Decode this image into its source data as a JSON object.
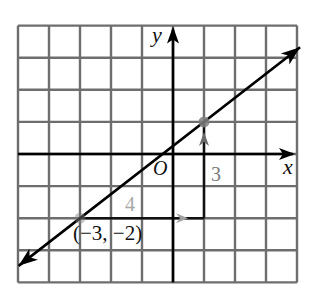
{
  "chart_data": {
    "type": "line",
    "title": "",
    "xlabel": "x",
    "ylabel": "y",
    "origin_label": "O",
    "xlim": [
      -5,
      4
    ],
    "ylim": [
      -4,
      4
    ],
    "grid": true,
    "grid_step": 1,
    "line": {
      "slope": 0.75,
      "intercept": 0.25,
      "equation_form": "y = (3/4)x + 1/4",
      "through_points": [
        [
          -3,
          -2
        ],
        [
          1,
          1
        ]
      ],
      "arrows_both_ends": true
    },
    "points": [
      {
        "x": -3,
        "y": -2,
        "label": "(−3, −2)"
      },
      {
        "x": 1,
        "y": 1,
        "label": ""
      }
    ],
    "annotations": [
      {
        "type": "run",
        "from": [
          -3,
          -2
        ],
        "to": [
          1,
          -2
        ],
        "value": 4,
        "label": "4"
      },
      {
        "type": "rise",
        "from": [
          1,
          -2
        ],
        "to": [
          1,
          1
        ],
        "value": 3,
        "label": "3"
      }
    ]
  },
  "labels": {
    "y_axis": "y",
    "x_axis": "x",
    "origin": "O",
    "rise": "3",
    "run": "4",
    "point": "(−3, −2)"
  },
  "colors": {
    "grid": "#6e6e6e",
    "axis": "#000000",
    "line": "#000000",
    "rise_label": "#7a7a7a",
    "run_label": "#a8a8a8",
    "run_arrow": "#a0a0a0",
    "rise_arrow": "#6a6a6a",
    "point": "#808080"
  }
}
